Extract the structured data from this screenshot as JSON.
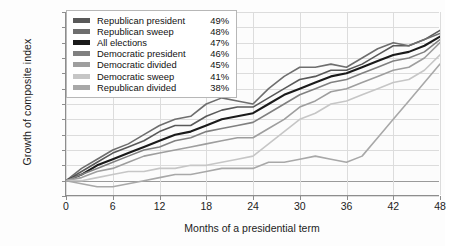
{
  "chart_data": {
    "type": "line",
    "title": "",
    "xlabel": "Months of a presidential term",
    "ylabel": "Growth of composite index",
    "xlim": [
      0,
      48
    ],
    "ylim": [
      -5,
      55
    ],
    "xticks": [
      0,
      6,
      12,
      18,
      24,
      30,
      36,
      42,
      48
    ],
    "yticks": [
      -5,
      0,
      5,
      10,
      15,
      20,
      25,
      30,
      35,
      40,
      45,
      50,
      55
    ],
    "ytick_labels": [
      "-5%",
      "0%",
      "5%",
      "10%",
      "15%",
      "20%",
      "25%",
      "30%",
      "35%",
      "40%",
      "45%",
      "50%",
      "55%"
    ],
    "xtick_labels": [
      "0",
      "6",
      "12",
      "18",
      "24",
      "30",
      "36",
      "42",
      "48"
    ],
    "grid": true,
    "legend_position": "top-left",
    "x": [
      0,
      2,
      4,
      6,
      8,
      10,
      12,
      14,
      16,
      18,
      20,
      22,
      24,
      26,
      28,
      30,
      32,
      34,
      36,
      38,
      40,
      42,
      44,
      46,
      48
    ],
    "series": [
      {
        "name": "Republican president",
        "final_label": "49%",
        "color": "#595959",
        "values": [
          0,
          3,
          6,
          9,
          11,
          13,
          16,
          18,
          18,
          21,
          23,
          24,
          24,
          27,
          30,
          33,
          34,
          36,
          36,
          38,
          41,
          44,
          44,
          46,
          49
        ]
      },
      {
        "name": "Republican sweep",
        "final_label": "48%",
        "color": "#6e6e6e",
        "values": [
          0,
          4,
          7,
          10,
          12,
          15,
          18,
          20,
          21,
          25,
          27,
          26,
          25,
          30,
          34,
          37,
          37,
          38,
          37,
          40,
          43,
          45,
          44,
          46,
          48
        ]
      },
      {
        "name": "All elections",
        "final_label": "47%",
        "color": "#1a1a1a",
        "values": [
          0,
          2,
          5,
          7,
          9,
          11,
          13,
          15,
          16,
          18,
          20,
          21,
          22,
          25,
          28,
          30,
          32,
          34,
          35,
          37,
          39,
          41,
          42,
          44,
          47
        ]
      },
      {
        "name": "Democratic president",
        "final_label": "46%",
        "color": "#808080",
        "values": [
          0,
          2,
          4,
          6,
          8,
          10,
          11,
          13,
          14,
          16,
          17,
          18,
          19,
          22,
          25,
          28,
          30,
          32,
          33,
          35,
          37,
          39,
          40,
          42,
          46
        ]
      },
      {
        "name": "Democratic divided",
        "final_label": "45%",
        "color": "#9e9e9e",
        "values": [
          0,
          1,
          3,
          4,
          6,
          8,
          9,
          10,
          11,
          12,
          13,
          14,
          14,
          17,
          20,
          24,
          26,
          29,
          30,
          32,
          34,
          36,
          37,
          40,
          45
        ]
      },
      {
        "name": "Democratic sweep",
        "final_label": "41%",
        "color": "#c6c6c6",
        "values": [
          0,
          0,
          1,
          2,
          3,
          3,
          4,
          4,
          5,
          5,
          6,
          7,
          8,
          12,
          16,
          20,
          22,
          25,
          26,
          28,
          30,
          32,
          33,
          36,
          41
        ]
      },
      {
        "name": "Republican divided",
        "final_label": "38%",
        "color": "#a8a8a8",
        "values": [
          0,
          -1,
          -2,
          -2,
          -1,
          0,
          1,
          2,
          2,
          3,
          4,
          4,
          4,
          6,
          6,
          7,
          8,
          7,
          6,
          8,
          14,
          20,
          26,
          32,
          38
        ]
      }
    ]
  },
  "legend": {
    "rows": [
      {
        "label": "Republican president",
        "value": "49%"
      },
      {
        "label": "Republican sweep",
        "value": "48%"
      },
      {
        "label": "All elections",
        "value": "47%"
      },
      {
        "label": "Democratic president",
        "value": "46%"
      },
      {
        "label": "Democratic divided",
        "value": "45%"
      },
      {
        "label": "Democratic sweep",
        "value": "41%"
      },
      {
        "label": "Republican divided",
        "value": "38%"
      }
    ]
  }
}
